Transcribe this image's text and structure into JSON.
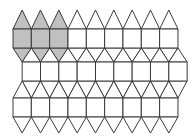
{
  "diagram": {
    "colors": {
      "stroke": "#3a3a3a",
      "fill": "#ffffff",
      "shaded": "#c0c0c0",
      "background": "#ffffff"
    },
    "geometry": {
      "square_size": 18.33,
      "triangle_height": 15.5,
      "columns_per_row": 9
    },
    "rows": [
      {
        "name": "row-1",
        "x_start": 13,
        "y_top": 29,
        "y_bottom": 48,
        "top_cap_apex_y": 10,
        "shaded_columns": [
          0,
          1,
          2
        ]
      },
      {
        "name": "row-2",
        "x_start": 22.17,
        "y_top": 62,
        "y_bottom": 81,
        "shaded_columns": []
      },
      {
        "name": "row-3",
        "x_start": 13,
        "y_top": 98,
        "y_bottom": 117,
        "bottom_cap_apex_y": 133,
        "shaded_columns": []
      }
    ]
  }
}
